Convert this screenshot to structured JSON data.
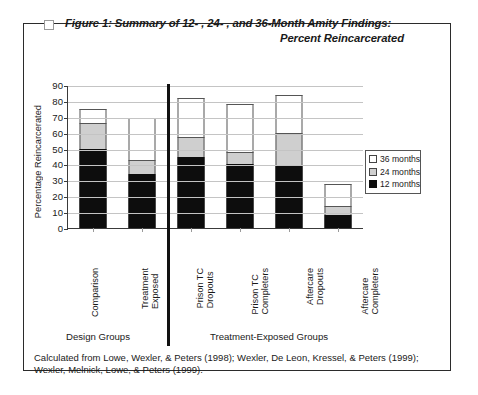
{
  "figure": {
    "bullet_icon": "square-bullet-icon",
    "title_line1": "Figure 1: Summary of 12- , 24- , and 36-Month Amity Findings:",
    "title_line2": "Percent Reincarcerated",
    "footnote_line1": "Calculated from Lowe, Wexler, & Peters (1998); Wexler, De Leon, Kressel, & Peters (1999);",
    "footnote_line2": "Wexler, Melnick, Lowe, & Peters (1999)."
  },
  "groups": {
    "design_label": "Design Groups",
    "treatment_label": "Treatment-Exposed Groups"
  },
  "legend": {
    "position": "right",
    "items": [
      {
        "label": "36 months",
        "color": "#ffffff"
      },
      {
        "label": "24 months",
        "color": "#cfcfcf"
      },
      {
        "label": "12 months",
        "color": "#0d0d0d"
      }
    ]
  },
  "chart_data": {
    "type": "bar",
    "stacked": true,
    "title": "Figure 1: Summary of 12- , 24- , and 36-Month Amity Findings: Percent Reincarcerated",
    "xlabel": "",
    "ylabel": "Percentage Reincarcerated",
    "ylim": [
      0,
      90
    ],
    "ytick_step": 10,
    "yticks": [
      90,
      80,
      70,
      60,
      50,
      40,
      30,
      20,
      10,
      0
    ],
    "grid": true,
    "legend_position": "right",
    "categories": [
      "Comparison",
      "Treatment\nExposed",
      "Prison TC\nDropouts",
      "Prison TC\nCompleters",
      "Aftercare\nDropouts",
      "Aftercare\nCompleters"
    ],
    "series": [
      {
        "name": "12 months",
        "color": "#0d0d0d",
        "values": [
          50,
          34,
          45,
          40,
          39,
          8
        ]
      },
      {
        "name": "24 months",
        "color": "#cfcfcf",
        "values": [
          16,
          9,
          12,
          8,
          21,
          6
        ]
      },
      {
        "name": "36 months",
        "color": "#ffffff",
        "values": [
          9,
          26,
          25,
          30,
          24,
          14
        ]
      }
    ],
    "cumulative_totals": [
      75,
      69,
      82,
      78,
      84,
      28
    ],
    "annotations": [
      {
        "text": "Design Groups",
        "covers": [
          "Comparison",
          "Treatment Exposed"
        ]
      },
      {
        "text": "Treatment-Exposed Groups",
        "covers": [
          "Prison TC Dropouts",
          "Prison TC Completers",
          "Aftercare Dropouts",
          "Aftercare Completers"
        ]
      }
    ]
  }
}
